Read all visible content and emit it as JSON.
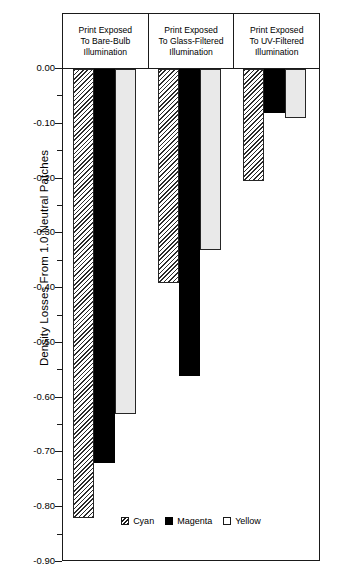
{
  "axis": {
    "y_title": "Density Losses From 1.0 Neutral Patches",
    "tick_labels": [
      "0.00",
      "-0.10",
      "-0.20",
      "-0.30",
      "-0.40",
      "-0.50",
      "-0.60",
      "-0.70",
      "-0.80",
      "-0.90"
    ]
  },
  "headers": [
    {
      "line1": "Print Exposed",
      "line2": "To Bare-Bulb",
      "line3": "Illumination"
    },
    {
      "line1": "Print Exposed",
      "line2": "To Glass-Filtered",
      "line3": "Illumination"
    },
    {
      "line1": "Print Exposed",
      "line2": "To UV-Filtered",
      "line3": "Illumination"
    }
  ],
  "legend": {
    "items": [
      {
        "label": "Cyan",
        "swatch": "hatched-swatch"
      },
      {
        "label": "Magenta",
        "swatch": "filled-black-swatch"
      },
      {
        "label": "Yellow",
        "swatch": "open-white-swatch"
      }
    ]
  },
  "chart_data": {
    "type": "bar",
    "title": "",
    "xlabel": "",
    "ylabel": "Density Losses From 1.0 Neutral Patches",
    "ylim": [
      -0.9,
      0.0
    ],
    "ytick_step": 0.1,
    "minor_tick_step": 0.05,
    "grid": false,
    "legend_position": "bottom-center",
    "categories": [
      "Print Exposed To Bare-Bulb Illumination",
      "Print Exposed To Glass-Filtered Illumination",
      "Print Exposed To UV-Filtered Illumination"
    ],
    "series": [
      {
        "name": "Cyan",
        "values": [
          -0.82,
          -0.39,
          -0.205
        ],
        "fill": "diagonal-hatch",
        "color": "#e8e8e8"
      },
      {
        "name": "Magenta",
        "values": [
          -0.72,
          -0.56,
          -0.08
        ],
        "fill": "solid",
        "color": "#000000"
      },
      {
        "name": "Yellow",
        "values": [
          -0.63,
          -0.33,
          -0.09
        ],
        "fill": "open",
        "color": "#e9e9e9"
      }
    ]
  }
}
